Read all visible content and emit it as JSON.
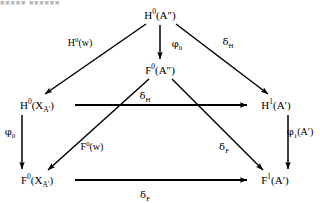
{
  "figure": {
    "title_remnant": "■■■■■  ■■■■■■",
    "width": 320,
    "height": 203,
    "ink_color": "#000000",
    "background_color": "#ffffff"
  },
  "diagram": {
    "type": "commutative-diagram",
    "nodes": [
      {
        "id": "H0App",
        "label_html": "H<sup>0</sup>(A″)",
        "plain": "H0(A'')",
        "x": 160,
        "y": 15
      },
      {
        "id": "F0App",
        "label_html": "F<sup>0</sup>(A″)",
        "plain": "F0(A'')",
        "x": 160,
        "y": 70
      },
      {
        "id": "H0XA",
        "label_html": "H<sup>0</sup>(X<sub>A′</sub>)",
        "plain": "H0(X_A')",
        "x": 37,
        "y": 105
      },
      {
        "id": "H1A",
        "label_html": "H<sup>1</sup>(A′)",
        "plain": "H1(A')",
        "x": 276,
        "y": 105
      },
      {
        "id": "F0XA",
        "label_html": "F<sup>0</sup>(X<sub>A′</sub>)",
        "plain": "F0(X_A')",
        "x": 37,
        "y": 180
      },
      {
        "id": "F1A",
        "label_html": "F<sup>1</sup>(A′)",
        "plain": "F1(A')",
        "x": 275,
        "y": 180
      }
    ],
    "edges": [
      {
        "id": "e1",
        "from": "H0App",
        "to": "H0XA",
        "label_html": "H<sup>0</sup>(w)",
        "plain": "H0(w)",
        "label_x": 80,
        "label_y": 43
      },
      {
        "id": "e2",
        "from": "H0App",
        "to": "F0App",
        "label_html": "<span class=\"gk\">φ</span><sub>0</sub>",
        "plain": "phi_0",
        "label_x": 177,
        "label_y": 44
      },
      {
        "id": "e3",
        "from": "H0App",
        "to": "H1A",
        "label_html": "<span class=\"gk\">δ</span><sub>H</sub>",
        "plain": "delta_H",
        "label_x": 228,
        "label_y": 42
      },
      {
        "id": "e4",
        "from": "F0App",
        "to": "F0XA",
        "label_html": "F<sup>0</sup>(w)",
        "plain": "F0(w)",
        "label_x": 92,
        "label_y": 147
      },
      {
        "id": "e5",
        "from": "F0App",
        "to": "F1A",
        "label_html": "<span class=\"gk\">δ</span><sub>F</sub>",
        "plain": "delta_F",
        "label_x": 224,
        "label_y": 147
      },
      {
        "id": "e6",
        "from": "H0XA",
        "to": "H1A",
        "label_html": "<span class=\"gk\">δ</span><sub>H</sub>",
        "plain": "delta_H",
        "label_x": 145,
        "label_y": 96
      },
      {
        "id": "e7",
        "from": "H0XA",
        "to": "F0XA",
        "label_html": "<span class=\"gk\">φ</span><sub>0</sub>",
        "plain": "phi_0",
        "label_x": 10,
        "label_y": 132
      },
      {
        "id": "e8",
        "from": "H1A",
        "to": "F1A",
        "label_html": "<span class=\"gk\">φ</span><sub>1</sub>(A′)",
        "plain": "phi_1(A')",
        "label_x": 300,
        "label_y": 132
      },
      {
        "id": "e9",
        "from": "F0XA",
        "to": "F1A",
        "label_html": "<span class=\"gk\">δ</span><sub>F</sub>",
        "plain": "delta_F",
        "label_x": 145,
        "label_y": 195
      }
    ]
  }
}
